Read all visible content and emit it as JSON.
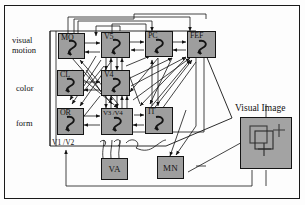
{
  "figure": {
    "title_right": "Visual Image",
    "row_labels": [
      {
        "id": "visual-motion",
        "line1": "visual",
        "line2": "motion"
      },
      {
        "id": "color",
        "line1": "color",
        "line2": ""
      },
      {
        "id": "form",
        "line1": "form",
        "line2": ""
      }
    ],
    "area_label": "V1 /V2",
    "nodes": [
      {
        "id": "mo",
        "label": "MO",
        "row": "visual motion"
      },
      {
        "id": "v5",
        "label": "V5",
        "row": "visual motion"
      },
      {
        "id": "pc",
        "label": "PC",
        "row": "visual motion"
      },
      {
        "id": "fef",
        "label": "FEF",
        "row": "visual motion"
      },
      {
        "id": "cl",
        "label": "CL",
        "row": "color"
      },
      {
        "id": "v4",
        "label": "V4",
        "row": "color"
      },
      {
        "id": "or",
        "label": "OR",
        "row": "form"
      },
      {
        "id": "v3v4",
        "label": "V3 /V4",
        "row": "form"
      },
      {
        "id": "it",
        "label": "IT",
        "row": "form"
      }
    ],
    "output_boxes": [
      {
        "id": "va",
        "label": "VA"
      },
      {
        "id": "mn",
        "label": "MN"
      }
    ],
    "colors": {
      "node_fill": "#9e9e9e",
      "panel_fill": "#a3a3a3",
      "stroke": "#141414",
      "background": "#fdfdfd"
    },
    "icon_names": {
      "recurrent_loop": "recurrent-loop-icon",
      "arrow": "arrow-icon",
      "crosshair": "crosshair-icon",
      "square_outline": "square-outline-icon"
    }
  }
}
